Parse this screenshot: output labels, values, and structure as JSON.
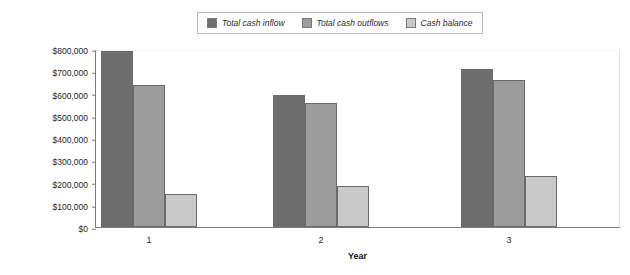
{
  "chart_data": {
    "type": "bar",
    "title": "",
    "xlabel": "Year",
    "ylabel": "",
    "categories": [
      "1",
      "2",
      "3"
    ],
    "series": [
      {
        "name": "Total cash inflow",
        "values": [
          790000,
          595000,
          710000
        ],
        "color": "#6e6e6e"
      },
      {
        "name": "Total cash outflows",
        "values": [
          640000,
          558000,
          660000
        ],
        "color": "#9c9c9c"
      },
      {
        "name": "Cash balance",
        "values": [
          147000,
          183000,
          228000
        ],
        "color": "#c9c9c9"
      }
    ],
    "ylim": [
      0,
      800000
    ],
    "yticks": [
      0,
      100000,
      200000,
      300000,
      400000,
      500000,
      600000,
      700000,
      800000
    ],
    "ytick_labels": [
      "$0",
      "$100,000",
      "$200,000",
      "$300,000",
      "$400,000",
      "$500,000",
      "$600,000",
      "$700,000",
      "$800,000"
    ],
    "grid": false,
    "legend_position": "top-center"
  }
}
